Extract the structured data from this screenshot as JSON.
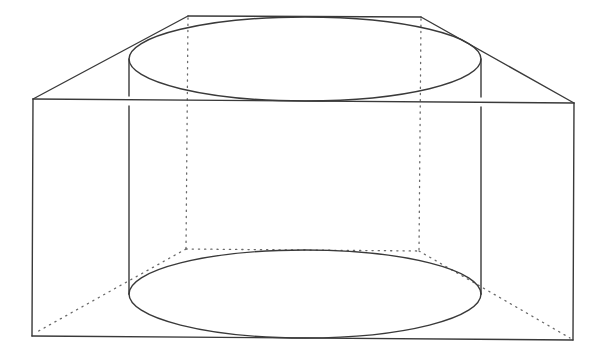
{
  "figure": {
    "stroke_color": "#3a3a3a",
    "hidden_stroke_color": "#6a6a6a",
    "background": "#ffffff",
    "prism": {
      "front_top_left": [
        33,
        99
      ],
      "front_top_right": [
        574,
        103
      ],
      "back_top_left": [
        188,
        16
      ],
      "back_top_right": [
        421,
        17
      ],
      "front_bottom_left": [
        32,
        336
      ],
      "front_bottom_right": [
        573,
        340
      ],
      "back_bottom_left": [
        186,
        249
      ],
      "back_bottom_right": [
        418,
        251
      ]
    },
    "cylinder": {
      "left_x": 129,
      "right_x": 481,
      "top_ellipse": {
        "cx": 305,
        "cy": 59,
        "rx": 176,
        "ry": 42
      },
      "bottom_ellipse": {
        "cx": 305,
        "cy": 294,
        "rx": 176,
        "ry": 44
      }
    }
  }
}
